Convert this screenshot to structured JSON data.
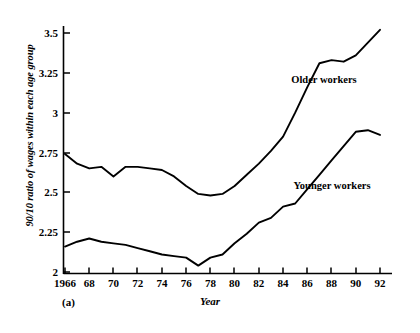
{
  "chart_data": {
    "type": "line",
    "title": "",
    "panel_caption": "(a)",
    "xlabel": "Year",
    "ylabel": "90/10 ratio of wages within each age group",
    "xlim": [
      1966,
      1993
    ],
    "ylim": [
      2,
      3.6
    ],
    "grid": false,
    "legend_position": "inline-annotation",
    "xticks": [
      1966,
      1968,
      1970,
      1972,
      1974,
      1976,
      1978,
      1980,
      1982,
      1984,
      1986,
      1988,
      1990,
      1992
    ],
    "xtick_labels": [
      "1966",
      "68",
      "70",
      "72",
      "74",
      "76",
      "78",
      "80",
      "82",
      "84",
      "86",
      "88",
      "90",
      "92"
    ],
    "yticks": [
      2,
      2.25,
      2.5,
      2.75,
      3,
      3.25,
      3.5
    ],
    "ytick_labels": [
      "2",
      "2.25",
      "2.5",
      "2.75",
      "3",
      "3.25",
      "3.5"
    ],
    "x": [
      1966,
      1967,
      1968,
      1969,
      1970,
      1971,
      1972,
      1973,
      1974,
      1975,
      1976,
      1977,
      1978,
      1979,
      1980,
      1981,
      1982,
      1983,
      1984,
      1985,
      1986,
      1987,
      1988,
      1989,
      1990,
      1991,
      1992
    ],
    "series": [
      {
        "name": "Older workers",
        "values": [
          2.74,
          2.68,
          2.65,
          2.66,
          2.6,
          2.66,
          2.66,
          2.65,
          2.64,
          2.6,
          2.54,
          2.49,
          2.48,
          2.49,
          2.54,
          2.61,
          2.68,
          2.76,
          2.85,
          3.0,
          3.16,
          3.31,
          3.33,
          3.32,
          3.36,
          3.44,
          3.52
        ]
      },
      {
        "name": "Younger workers",
        "values": [
          2.16,
          2.19,
          2.21,
          2.19,
          2.18,
          2.17,
          2.15,
          2.13,
          2.11,
          2.1,
          2.09,
          2.04,
          2.09,
          2.11,
          2.18,
          2.24,
          2.31,
          2.34,
          2.41,
          2.43,
          2.52,
          2.61,
          2.7,
          2.79,
          2.88,
          2.89,
          2.86
        ]
      }
    ],
    "annotations": [
      {
        "text": "Older workers",
        "x": 1987,
        "y": 3.09
      },
      {
        "text": "Younger workers",
        "x": 1988,
        "y": 2.45
      }
    ],
    "colors": {
      "line": "#000000",
      "background": "#ffffff",
      "axis": "#000000"
    }
  }
}
